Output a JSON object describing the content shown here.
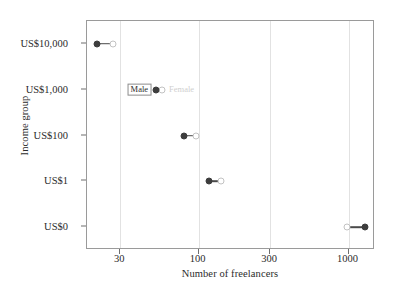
{
  "chart_data": {
    "type": "scatter",
    "subtype": "dumbbell",
    "title": "",
    "xlabel": "Number of freelancers",
    "ylabel": "Income group",
    "xscale": "log",
    "xticks": [
      30,
      100,
      300,
      1000
    ],
    "xtick_labels": [
      "30",
      "100",
      "300",
      "1000"
    ],
    "xlim": [
      18,
      1500
    ],
    "grid": "vertical",
    "categories": [
      "US$10,000",
      "US$1,000",
      "US$100",
      "US$1",
      "US$0"
    ],
    "legend": {
      "position": "inline-at-US$1,000",
      "entries": [
        {
          "name": "Male",
          "color": "#3d3d3d",
          "marker": "filled-circle"
        },
        {
          "name": "Female",
          "color": "#cfcfcf",
          "marker": "open-circle"
        }
      ]
    },
    "series": [
      {
        "name": "Male",
        "color": "#3d3d3d",
        "values": [
          21,
          52,
          80,
          117,
          1290
        ]
      },
      {
        "name": "Female",
        "color": "#cfcfcf",
        "values": [
          27,
          57,
          96,
          142,
          970
        ]
      }
    ],
    "rows": [
      {
        "category": "US$10,000",
        "male": 21,
        "female": 27
      },
      {
        "category": "US$1,000",
        "male": 52,
        "female": 57
      },
      {
        "category": "US$100",
        "male": 80,
        "female": 96
      },
      {
        "category": "US$1",
        "male": 117,
        "female": 142
      },
      {
        "category": "US$0",
        "male": 1290,
        "female": 970
      }
    ]
  },
  "colors": {
    "male": "#3d3d3d",
    "female": "#cfcfcf",
    "connector": "#4a4a4a",
    "grid": "#e2e2e2",
    "panel_border": "#9a9a9a",
    "text": "#2b2b2b"
  }
}
